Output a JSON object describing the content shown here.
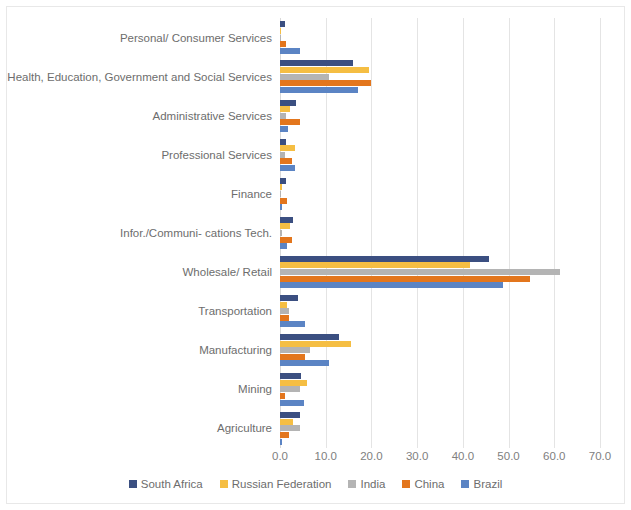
{
  "chart_data": {
    "type": "bar",
    "orientation": "horizontal",
    "title": "",
    "xlabel": "",
    "ylabel": "",
    "xlim": [
      0,
      70
    ],
    "xticks": [
      "0.0",
      "10.0",
      "20.0",
      "30.0",
      "40.0",
      "50.0",
      "60.0",
      "70.0"
    ],
    "xtick_values": [
      0,
      10,
      20,
      30,
      40,
      50,
      60,
      70
    ],
    "grid": true,
    "legend_position": "bottom",
    "categories": [
      "Personal/ Consumer Services",
      "Health, Education, Government and Social Services",
      "Administrative Services",
      "Professional Services",
      "Finance",
      "Infor./Communi- cations Tech.",
      "Wholesale/ Retail",
      "Transportation",
      "Manufacturing",
      "Mining",
      "Agriculture"
    ],
    "series": [
      {
        "name": "South Africa",
        "color": "#3b4f81",
        "values": [
          1.2,
          15.9,
          3.5,
          1.4,
          1.3,
          2.8,
          45.7,
          4.0,
          12.8,
          4.5,
          4.3
        ]
      },
      {
        "name": "Russian Federation",
        "color": "#f5be43",
        "values": [
          0.3,
          19.5,
          2.2,
          3.2,
          0.4,
          2.2,
          41.6,
          1.6,
          15.5,
          6.0,
          2.9
        ]
      },
      {
        "name": "India",
        "color": "#b4b4b4",
        "values": [
          0.1,
          10.8,
          1.3,
          1.0,
          0.1,
          0.4,
          61.3,
          2.0,
          6.6,
          4.4,
          4.3
        ]
      },
      {
        "name": "China",
        "color": "#e3761d",
        "values": [
          1.3,
          19.9,
          4.4,
          2.6,
          1.5,
          2.7,
          54.7,
          1.9,
          5.5,
          1.0,
          1.9
        ]
      },
      {
        "name": "Brazil",
        "color": "#5b84c4",
        "values": [
          4.3,
          17.0,
          1.7,
          3.3,
          0.4,
          1.5,
          48.8,
          5.4,
          10.7,
          5.3,
          0.4
        ]
      }
    ]
  }
}
